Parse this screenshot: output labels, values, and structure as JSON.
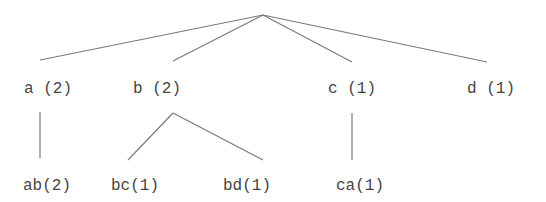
{
  "diagram": {
    "type": "tree",
    "root": {
      "id": "root",
      "label": "",
      "x": 263,
      "y": 15
    },
    "nodes": [
      {
        "id": "a",
        "label": "a (2)",
        "count": 2,
        "parent": "root",
        "text_x": 24,
        "text_y": 93,
        "anchor_x": 40,
        "anchor_top_y": 60,
        "anchor_bottom_y": 112
      },
      {
        "id": "b",
        "label": "b (2)",
        "count": 2,
        "parent": "root",
        "text_x": 133,
        "text_y": 93,
        "anchor_x": 173,
        "anchor_top_y": 61,
        "anchor_bottom_y": 113
      },
      {
        "id": "c",
        "label": "c (1)",
        "count": 1,
        "parent": "root",
        "text_x": 328,
        "text_y": 93,
        "anchor_x": 352,
        "anchor_top_y": 62,
        "anchor_bottom_y": 113
      },
      {
        "id": "d",
        "label": "d (1)",
        "count": 1,
        "parent": "root",
        "text_x": 467,
        "text_y": 93,
        "anchor_x": 487,
        "anchor_top_y": 62,
        "anchor_bottom_y": 113
      },
      {
        "id": "ab",
        "label": "ab(2)",
        "count": 2,
        "parent": "a",
        "text_x": 23,
        "text_y": 190,
        "anchor_x": 40,
        "anchor_top_y": 158
      },
      {
        "id": "bc",
        "label": "bc(1)",
        "count": 1,
        "parent": "b",
        "text_x": 111,
        "text_y": 190,
        "anchor_x": 128,
        "anchor_top_y": 160
      },
      {
        "id": "bd",
        "label": "bd(1)",
        "count": 1,
        "parent": "b",
        "text_x": 223,
        "text_y": 190,
        "anchor_x": 263,
        "anchor_top_y": 160
      },
      {
        "id": "ca",
        "label": "ca(1)",
        "count": 1,
        "parent": "c",
        "text_x": 336,
        "text_y": 190,
        "anchor_x": 352,
        "anchor_top_y": 160
      }
    ],
    "colors": {
      "edge": "#7a7a7a",
      "text": "#444444",
      "background": "#ffffff"
    }
  }
}
